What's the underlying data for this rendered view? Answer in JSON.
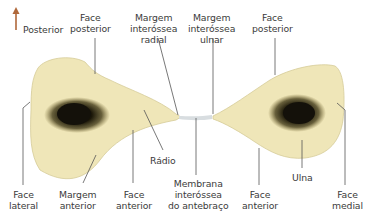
{
  "orientation": {
    "arrow_label": "Posterior",
    "arrow_color": "#b0683a"
  },
  "colors": {
    "bone_fill": "#efe6b8",
    "bone_edge": "#d6cc98",
    "marrow": "#1a1608",
    "leader_line": "#555555",
    "membrane": "#d8dde0"
  },
  "labels": {
    "face_posterior_radius": [
      "Face",
      "posterior"
    ],
    "margem_interossea_radial": [
      "Margem",
      "interóssea",
      "radial"
    ],
    "margem_interossea_ulnar": [
      "Margem",
      "interóssea",
      "ulnar"
    ],
    "face_posterior_ulna": [
      "Face",
      "posterior"
    ],
    "radio": "Rádio",
    "ulna": "Ulna",
    "face_lateral": [
      "Face",
      "lateral"
    ],
    "margem_anterior": [
      "Margem",
      "anterior"
    ],
    "face_anterior_radius": [
      "Face",
      "anterior"
    ],
    "membrana": [
      "Membrana",
      "interóssea",
      "do antebraço"
    ],
    "face_anterior_ulna": [
      "Face",
      "anterior"
    ],
    "face_medial": [
      "Face",
      "medial"
    ]
  }
}
